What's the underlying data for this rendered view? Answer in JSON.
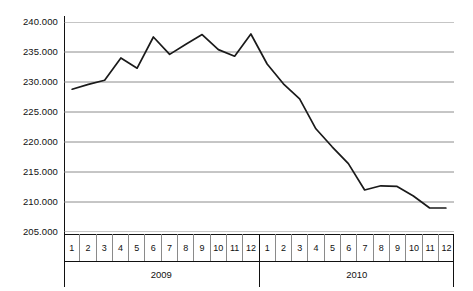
{
  "chart_data": {
    "type": "line",
    "title": "",
    "subtitle": "",
    "xlabel": "",
    "ylabel": "",
    "ylim": [
      205000,
      240000
    ],
    "grid": true,
    "legend": "none",
    "y_ticks": [
      240000,
      235000,
      230000,
      225000,
      220000,
      215000,
      210000,
      205000
    ],
    "y_tick_labels": [
      "240.000",
      "235.000",
      "230.000",
      "225.000",
      "220.000",
      "215.000",
      "210.000",
      "205.000"
    ],
    "x_group_labels": [
      "2009",
      "2010"
    ],
    "x_tick_labels": [
      "1",
      "2",
      "3",
      "4",
      "5",
      "6",
      "7",
      "8",
      "9",
      "10",
      "11",
      "12",
      "1",
      "2",
      "3",
      "4",
      "5",
      "6",
      "7",
      "8",
      "9",
      "10",
      "11",
      "12"
    ],
    "categories": [
      "2009-1",
      "2009-2",
      "2009-3",
      "2009-4",
      "2009-5",
      "2009-6",
      "2009-7",
      "2009-8",
      "2009-9",
      "2009-10",
      "2009-11",
      "2009-12",
      "2010-1",
      "2010-2",
      "2010-3",
      "2010-4",
      "2010-5",
      "2010-6",
      "2010-7",
      "2010-8",
      "2010-9",
      "2010-10",
      "2010-11",
      "2010-12"
    ],
    "series": [
      {
        "name": "",
        "color": "#1a1a1a",
        "values": [
          228800,
          229600,
          230300,
          234000,
          232300,
          237500,
          234600,
          236300,
          237900,
          235400,
          234300,
          238000,
          233000,
          229700,
          227200,
          222200,
          219200,
          216400,
          212000,
          212700,
          212600,
          211000,
          209000,
          209000
        ]
      }
    ]
  },
  "axis": {
    "y_tick_labels": [
      "240.000",
      "235.000",
      "230.000",
      "225.000",
      "220.000",
      "215.000",
      "210.000",
      "205.000"
    ],
    "months_2009": [
      "1",
      "2",
      "3",
      "4",
      "5",
      "6",
      "7",
      "8",
      "9",
      "10",
      "11",
      "12"
    ],
    "months_2010": [
      "1",
      "2",
      "3",
      "4",
      "5",
      "6",
      "7",
      "8",
      "9",
      "10",
      "11",
      "12"
    ],
    "year_2009": "2009",
    "year_2010": "2010"
  },
  "style": {
    "line_color": "#1a1a1a",
    "grid_color": "#8c8c8c",
    "axis_color": "#111111",
    "background": "#ffffff"
  }
}
